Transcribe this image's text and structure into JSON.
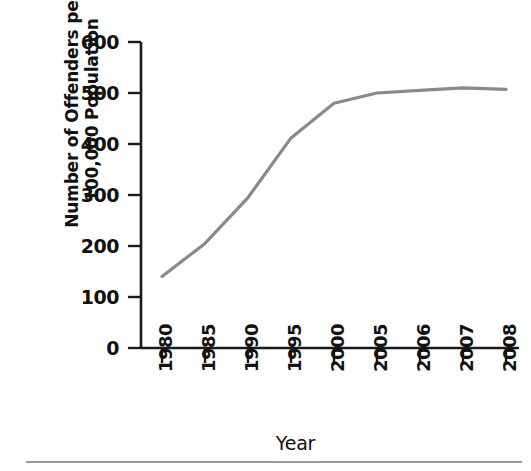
{
  "chart_data": {
    "type": "line",
    "title": "",
    "xlabel": "Year",
    "ylabel": "Number of Offenders per 100,000 Population",
    "ylabel_lines": [
      "Number of Offenders per",
      "100,000 Population"
    ],
    "categories": [
      "1980",
      "1985",
      "1990",
      "1995",
      "2000",
      "2005",
      "2006",
      "2007",
      "2008"
    ],
    "values": [
      140,
      205,
      295,
      412,
      480,
      500,
      505,
      510,
      507
    ],
    "series": [
      {
        "name": "Offenders per 100,000 Population",
        "values": [
          140,
          205,
          295,
          412,
          480,
          500,
          505,
          510,
          507
        ]
      }
    ],
    "yticks": [
      "0",
      "100",
      "200",
      "300",
      "400",
      "500",
      "600"
    ],
    "ytick_values": [
      0,
      100,
      200,
      300,
      400,
      500,
      600
    ],
    "ylim": [
      0,
      600
    ],
    "grid": false,
    "legend": false,
    "legend_position": "none",
    "line_color": "#8a8a8a",
    "axis_color": "#1a1a1a",
    "xtick_rotation": 90
  },
  "axes": {
    "y_title_line1": "Number of Offenders per",
    "y_title_line2": "100,000 Population",
    "x_title": "Year"
  },
  "ytick_labels": [
    "600",
    "500",
    "400",
    "300",
    "200",
    "100",
    "0"
  ],
  "xtick_labels": [
    "1980",
    "1985",
    "1990",
    "1995",
    "2000",
    "2005",
    "2006",
    "2007",
    "2008"
  ]
}
